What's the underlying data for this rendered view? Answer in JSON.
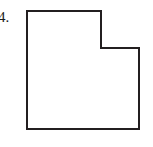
{
  "figure": {
    "label": "4.",
    "background_color": "#ffffff",
    "shape": {
      "name": "L-shaped hexagon",
      "fill_color": "#ffffff",
      "stroke_color": "#231f20",
      "stroke_width": 2,
      "vertices": [
        [
          27,
          11
        ],
        [
          101,
          11
        ],
        [
          101,
          48
        ],
        [
          139,
          48
        ],
        [
          139,
          129
        ],
        [
          27,
          129
        ]
      ],
      "points_string": "27,11 101,11 101,48 139,48 139,129 27,129"
    }
  }
}
